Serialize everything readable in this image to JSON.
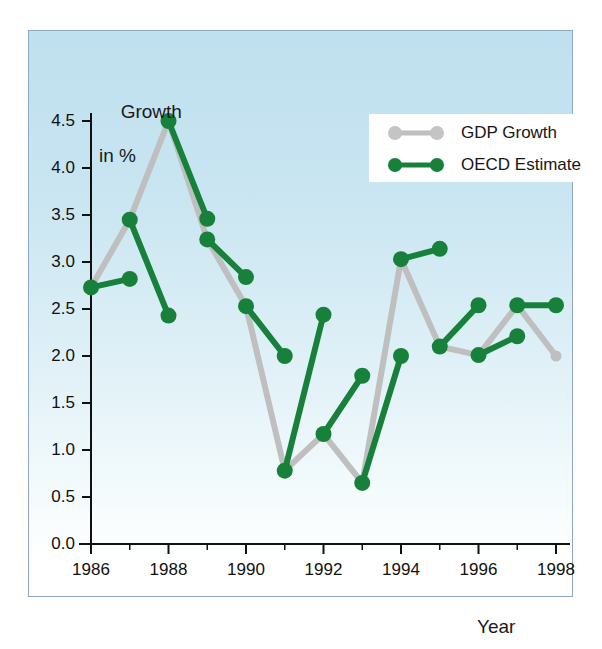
{
  "chart_data": {
    "type": "line",
    "title": "",
    "xlabel": "Year",
    "ylabel": "Growth in %",
    "ylabel_line1": "Growth",
    "ylabel_line2": "in %",
    "xlim": [
      1986,
      1998
    ],
    "ylim": [
      0.0,
      4.5
    ],
    "grid": false,
    "legend_position": "top-right",
    "ytick_labels": [
      "0.0",
      "0.5",
      "1.0",
      "1.5",
      "2.0",
      "2.5",
      "3.0",
      "3.5",
      "4.0",
      "4.5"
    ],
    "ytick_values": [
      0.0,
      0.5,
      1.0,
      1.5,
      2.0,
      2.5,
      3.0,
      3.5,
      4.0,
      4.5
    ],
    "xtick_labels": [
      "1986",
      "1988",
      "1990",
      "1992",
      "1994",
      "1996",
      "1998"
    ],
    "xtick_values": [
      1986,
      1988,
      1990,
      1992,
      1994,
      1996,
      1998
    ],
    "xtick_minor_values": [
      1987,
      1989,
      1991,
      1993,
      1995,
      1997
    ],
    "colors": {
      "gdp_growth": "#bfbfbf",
      "oecd_estimate": "#17813c",
      "background_top": "#bfe0ee",
      "background_bottom": "#ffffff",
      "panel_border": "#8fa8c8",
      "axis": "#111111",
      "text": "#111111"
    },
    "series": [
      {
        "name": "GDP Growth",
        "color": "#bfbfbf",
        "style": "continuous-line",
        "x": [
          1986,
          1987,
          1988,
          1989,
          1990,
          1991,
          1992,
          1993,
          1994,
          1995,
          1996,
          1997,
          1998
        ],
        "values": [
          2.73,
          3.45,
          4.5,
          3.24,
          2.53,
          0.78,
          1.17,
          0.65,
          3.03,
          2.1,
          2.01,
          2.54,
          2.0
        ]
      },
      {
        "name": "OECD Estimate",
        "color": "#17813c",
        "style": "paired-segments",
        "segments": [
          {
            "x": [
              1986,
              1987
            ],
            "values": [
              2.73,
              2.82
            ]
          },
          {
            "x": [
              1987,
              1988
            ],
            "values": [
              3.45,
              2.43
            ]
          },
          {
            "x": [
              1988,
              1989
            ],
            "values": [
              4.5,
              3.46
            ]
          },
          {
            "x": [
              1989,
              1990
            ],
            "values": [
              3.24,
              2.84
            ]
          },
          {
            "x": [
              1990,
              1991
            ],
            "values": [
              2.53,
              2.0
            ]
          },
          {
            "x": [
              1991,
              1992
            ],
            "values": [
              0.78,
              2.44
            ]
          },
          {
            "x": [
              1992,
              1993
            ],
            "values": [
              1.17,
              1.79
            ]
          },
          {
            "x": [
              1993,
              1994
            ],
            "values": [
              0.65,
              2.0
            ]
          },
          {
            "x": [
              1994,
              1995
            ],
            "values": [
              3.03,
              3.14
            ]
          },
          {
            "x": [
              1995,
              1996
            ],
            "values": [
              2.1,
              2.54
            ]
          },
          {
            "x": [
              1996,
              1997
            ],
            "values": [
              2.01,
              2.21
            ]
          },
          {
            "x": [
              1997,
              1998
            ],
            "values": [
              2.54,
              2.54
            ]
          }
        ]
      }
    ]
  },
  "legend": {
    "items": [
      {
        "label": "GDP Growth",
        "color": "#bfbfbf"
      },
      {
        "label": "OECD Estimate",
        "color": "#17813c"
      }
    ]
  }
}
